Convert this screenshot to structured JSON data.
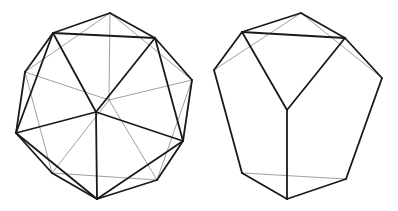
{
  "colors": {
    "background": "#ffffff",
    "visible_edge": "#1a1a1a",
    "hidden_edge": "#777777"
  },
  "figures": [
    {
      "name": "icosahedron-like polyhedron",
      "vertices": {
        "T": [
          110,
          13
        ],
        "UL": [
          53,
          33
        ],
        "UR": [
          155,
          38
        ],
        "LU": [
          25,
          72
        ],
        "R": [
          192,
          80
        ],
        "H": [
          109,
          100
        ],
        "C": [
          96,
          112
        ],
        "L": [
          16,
          133
        ],
        "RL": [
          183,
          141
        ],
        "BL": [
          52,
          173
        ],
        "BR": [
          157,
          180
        ],
        "B": [
          97,
          199
        ]
      },
      "visible_edges": [
        [
          "T",
          "UL"
        ],
        [
          "T",
          "UR"
        ],
        [
          "UL",
          "UR"
        ],
        [
          "UL",
          "LU"
        ],
        [
          "UL",
          "L"
        ],
        [
          "UL",
          "C"
        ],
        [
          "UR",
          "C"
        ],
        [
          "UR",
          "R"
        ],
        [
          "UR",
          "RL"
        ],
        [
          "R",
          "RL"
        ],
        [
          "LU",
          "L"
        ],
        [
          "L",
          "C"
        ],
        [
          "RL",
          "C"
        ],
        [
          "C",
          "B"
        ],
        [
          "L",
          "B"
        ],
        [
          "RL",
          "B"
        ],
        [
          "RL",
          "BR"
        ],
        [
          "BR",
          "B"
        ],
        [
          "L",
          "BL"
        ],
        [
          "BL",
          "B"
        ]
      ],
      "hidden_edges": [
        [
          "T",
          "H"
        ],
        [
          "LU",
          "H"
        ],
        [
          "R",
          "H"
        ],
        [
          "BL",
          "H"
        ],
        [
          "BR",
          "H"
        ],
        [
          "T",
          "LU"
        ],
        [
          "T",
          "R"
        ],
        [
          "LU",
          "BL"
        ],
        [
          "R",
          "BR"
        ],
        [
          "BL",
          "BR"
        ]
      ]
    },
    {
      "name": "truncated polyhedron",
      "vertices": {
        "T": [
          301,
          13
        ],
        "UL": [
          242,
          32
        ],
        "UR": [
          345,
          38
        ],
        "L": [
          214,
          70
        ],
        "R": [
          382,
          78
        ],
        "C": [
          287,
          110
        ],
        "BL": [
          242,
          173
        ],
        "BR": [
          346,
          179
        ],
        "B": [
          287,
          199
        ]
      },
      "visible_edges": [
        [
          "T",
          "UL"
        ],
        [
          "T",
          "UR"
        ],
        [
          "UL",
          "UR"
        ],
        [
          "UL",
          "L"
        ],
        [
          "UR",
          "R"
        ],
        [
          "UL",
          "C"
        ],
        [
          "UR",
          "C"
        ],
        [
          "L",
          "BL"
        ],
        [
          "R",
          "BR"
        ],
        [
          "C",
          "B"
        ],
        [
          "BL",
          "B"
        ],
        [
          "BR",
          "B"
        ]
      ],
      "hidden_edges": [
        [
          "T",
          "L"
        ],
        [
          "T",
          "R"
        ],
        [
          "BL",
          "BR"
        ]
      ]
    }
  ]
}
